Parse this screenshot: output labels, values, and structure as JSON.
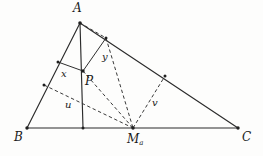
{
  "figure": {
    "background_color": "#fdfdfc",
    "stroke_color": "#2b2b2b",
    "dash_color": "#3a3a3a"
  },
  "labels": {
    "vertex_a": "A",
    "vertex_b": "B",
    "vertex_c": "C",
    "point_p": "P",
    "midpoint_ma_base": "M",
    "midpoint_ma_sub": "a",
    "segment_x": "x",
    "segment_y": "y",
    "segment_u": "u",
    "segment_v": "v"
  },
  "label_positions": {
    "vertex_a": {
      "x": 73,
      "y": 2
    },
    "vertex_b": {
      "x": 14,
      "y": 131
    },
    "vertex_c": {
      "x": 242,
      "y": 131
    },
    "point_p": {
      "x": 85,
      "y": 75
    },
    "midpoint_ma": {
      "x": 127,
      "y": 133
    },
    "segment_x": {
      "x": 61,
      "y": 69
    },
    "segment_y": {
      "x": 102,
      "y": 52
    },
    "segment_u": {
      "x": 65,
      "y": 100
    },
    "segment_v": {
      "x": 152,
      "y": 98
    }
  },
  "points": {
    "A": {
      "x": 80,
      "y": 23
    },
    "B": {
      "x": 27,
      "y": 128
    },
    "C": {
      "x": 238,
      "y": 128
    },
    "Ma": {
      "x": 133,
      "y": 128
    },
    "P": {
      "x": 83,
      "y": 71
    },
    "foot_x_on_AB": {
      "x": 58,
      "y": 62
    },
    "foot_u_on_AB": {
      "x": 44,
      "y": 85
    },
    "foot_y_on_AC": {
      "x": 106,
      "y": 38
    },
    "foot_v_on_AC": {
      "x": 165,
      "y": 76
    },
    "foot_altitude_on_BC": {
      "x": 83,
      "y": 128
    }
  },
  "segments": {
    "solid": [
      {
        "name": "side-AB",
        "from": "A",
        "to": "B"
      },
      {
        "name": "side-BC",
        "from": "B",
        "to": "C"
      },
      {
        "name": "side-AC",
        "from": "A",
        "to": "C"
      },
      {
        "name": "altitude-A-to-BC",
        "from": "A",
        "to": "foot_altitude_on_BC"
      },
      {
        "name": "segment-x-footAB-to-P",
        "from": "foot_x_on_AB",
        "to": "P"
      },
      {
        "name": "segment-y-P-to-footAC",
        "from": "P",
        "to": "foot_y_on_AC"
      }
    ],
    "dashed": [
      {
        "name": "dashed-A-to-footAC",
        "from": "A",
        "to": "foot_y_on_AC"
      },
      {
        "name": "segment-u-footAB-to-Ma",
        "from": "foot_u_on_AB",
        "to": "Ma"
      },
      {
        "name": "segment-v-Ma-to-footAC",
        "from": "Ma",
        "to": "foot_v_on_AC"
      },
      {
        "name": "dashed-P-to-Ma",
        "from": "P",
        "to": "Ma"
      },
      {
        "name": "dashed-footAC-to-Ma",
        "from": "foot_y_on_AC",
        "to": "Ma"
      }
    ]
  }
}
